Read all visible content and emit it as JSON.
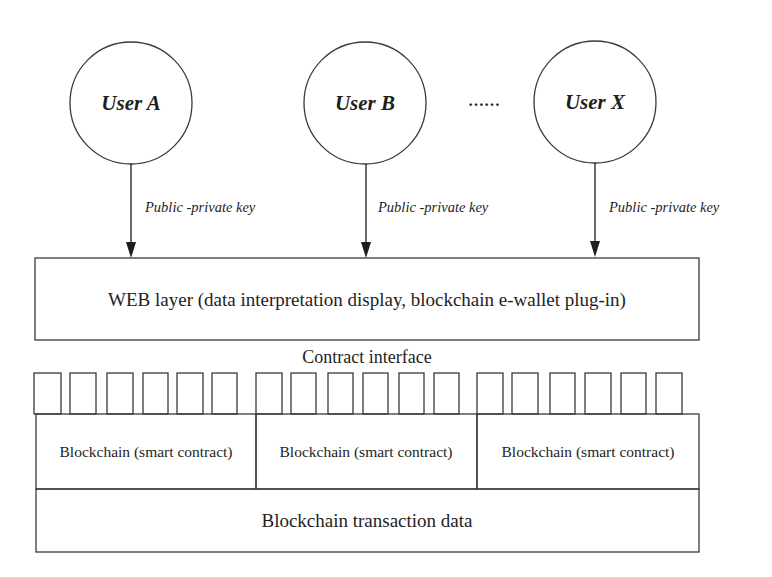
{
  "diagram": {
    "type": "layered-architecture",
    "colors": {
      "stroke": "#3a3a3a",
      "text": "#1e1e1e",
      "background": "#ffffff"
    },
    "users": [
      {
        "label": "User A",
        "cx": 131,
        "cy": 103,
        "r": 61
      },
      {
        "label": "User B",
        "cx": 365,
        "cy": 103,
        "r": 61
      },
      {
        "label": "User X",
        "cx": 595,
        "cy": 102,
        "r": 61
      }
    ],
    "ellipsis": "……",
    "arrows": [
      {
        "label": "Public -private key",
        "x": 131
      },
      {
        "label": "Public -private key",
        "x": 366
      },
      {
        "label": "Public -private key",
        "x": 595
      }
    ],
    "web_layer": {
      "label": "WEB layer (data interpretation display, blockchain e-wallet plug-in)"
    },
    "contract_interface": {
      "label": "Contract interface",
      "slot_count": 18
    },
    "smart_contracts": [
      {
        "label": "Blockchain (smart contract)"
      },
      {
        "label": "Blockchain (smart contract)"
      },
      {
        "label": "Blockchain (smart contract)"
      }
    ],
    "transaction_data": {
      "label": "Blockchain transaction data"
    }
  }
}
